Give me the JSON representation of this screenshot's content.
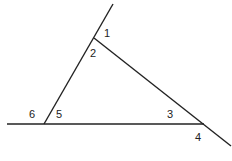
{
  "diagram": {
    "type": "triangle-exterior-angles",
    "line_color": "#222222",
    "angles": [
      {
        "id": "1",
        "label": "1",
        "x": 104,
        "y": 37
      },
      {
        "id": "2",
        "label": "2",
        "x": 90,
        "y": 57
      },
      {
        "id": "3",
        "label": "3",
        "x": 167,
        "y": 118
      },
      {
        "id": "4",
        "label": "4",
        "x": 195,
        "y": 141
      },
      {
        "id": "5",
        "label": "5",
        "x": 56,
        "y": 118
      },
      {
        "id": "6",
        "label": "6",
        "x": 29,
        "y": 118
      }
    ]
  }
}
